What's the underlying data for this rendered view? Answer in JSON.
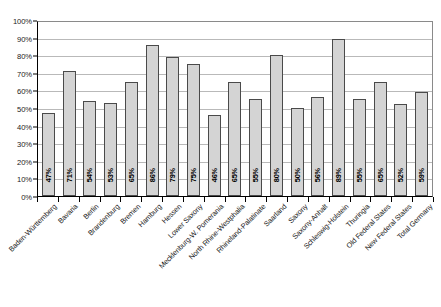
{
  "chart_data": {
    "type": "bar",
    "title": "",
    "subtitle": "",
    "xlabel": "",
    "ylabel": "",
    "ylim": [
      0,
      100
    ],
    "grid": true,
    "legend": "none",
    "y_ticks": [
      "0%",
      "10%",
      "20%",
      "30%",
      "40%",
      "50%",
      "60%",
      "70%",
      "80%",
      "90%",
      "100%"
    ],
    "y_tick_values": [
      0,
      10,
      20,
      30,
      40,
      50,
      60,
      70,
      80,
      90,
      100
    ],
    "categories": [
      "Baden-Württemberg",
      "Bavaria",
      "Berlin",
      "Brandenburg",
      "Bremen",
      "Hamburg",
      "Hessen",
      "Lower Saxony",
      "Mecklenburg-W. Pomerania",
      "North Rhine-Westphalia",
      "Rhineland-Palatinate",
      "Saarland",
      "Saxony",
      "Saxony-Anhalt",
      "Schleswig-Holstein",
      "Thuringia",
      "Old Federal States",
      "New Federal States",
      "Total Germany"
    ],
    "values": [
      47,
      71,
      54,
      53,
      65,
      86,
      79,
      75,
      46,
      65,
      55,
      80,
      50,
      56,
      89,
      55,
      65,
      52,
      59
    ],
    "value_labels": [
      "47%",
      "71%",
      "54%",
      "53%",
      "65%",
      "86%",
      "79%",
      "75%",
      "46%",
      "65%",
      "55%",
      "80%",
      "50%",
      "56%",
      "89%",
      "55%",
      "65%",
      "52%",
      "59%"
    ]
  },
  "style": {
    "bar_fill": "#d4d4d4",
    "bar_border": "#4a4a4a",
    "gridline_color": "#b9b9b9",
    "axis_color": "#000000",
    "text_color": "#1a1a1a",
    "background": "#ffffff"
  }
}
